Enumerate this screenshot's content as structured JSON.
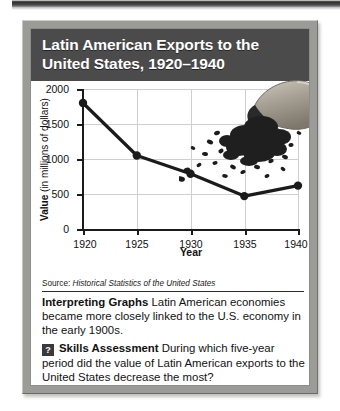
{
  "panel": {
    "title_lines": [
      "Latin American Exports to the",
      "United States, 1920–1940"
    ],
    "decoration_icon": "coffee-sack-spilling-beans-icon",
    "banner_color": "#4b4b4b",
    "frame_color": "#9b9b97"
  },
  "chart_data": {
    "type": "line",
    "title": "Latin American Exports to the United States, 1920–1940",
    "xlabel": "Year",
    "ylabel": "Value (in millions of dollars)",
    "ylabel_bold_prefix": "Value",
    "ylabel_rest": " (in millions of dollars)",
    "x": [
      1920,
      1925,
      1930,
      1935,
      1940
    ],
    "values": [
      1800,
      1050,
      790,
      470,
      620
    ],
    "categories": [
      "1920",
      "1925",
      "1930",
      "1935",
      "1940"
    ],
    "xtick_labels": [
      "1920",
      "1925",
      "1930",
      "1935",
      "1940"
    ],
    "ytick_labels": [
      "0",
      "500",
      "1000",
      "1500",
      "2000"
    ],
    "ytick_values": [
      0,
      500,
      1000,
      1500,
      2000
    ],
    "ylim": [
      0,
      2000
    ],
    "xlim": [
      1920,
      1940
    ],
    "grid": true,
    "legend": "none",
    "line_color": "#1b1b1b",
    "marker": "circle"
  },
  "source": {
    "label": "Source:",
    "text": " Historical Statistics of the United States"
  },
  "body": {
    "interpreting_heading": "Interpreting Graphs",
    "interpreting_text": " Latin American economies became more closely linked to the U.S. economy in the early 1900s.",
    "badge_glyph": "?",
    "skills_heading": "Skills Assessment",
    "skills_text": " During which five-year period did the value of Latin American exports to the United States decrease the most?"
  }
}
